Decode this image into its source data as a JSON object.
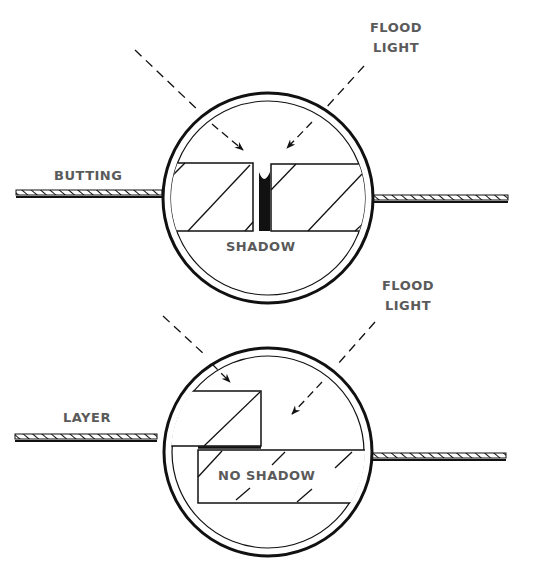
{
  "colors": {
    "ink": "#111111",
    "label": "#5a5a5a",
    "background": "#ffffff"
  },
  "top_panel": {
    "light_label_line1": "FLOOD",
    "light_label_line2": "LIGHT",
    "joint_label": "BUTTING",
    "result_label": "SHADOW"
  },
  "bottom_panel": {
    "light_label_line1": "FLOOD",
    "light_label_line2": "LIGHT",
    "joint_label": "LAYER",
    "result_label": "NO SHADOW"
  }
}
